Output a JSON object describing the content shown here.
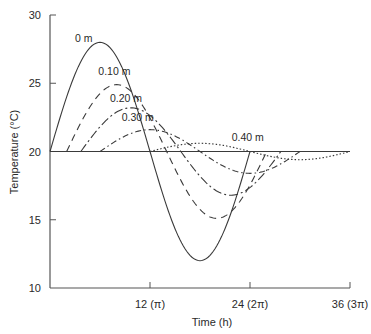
{
  "chart_data": {
    "type": "line",
    "title": "",
    "xlabel": "Time (h)",
    "ylabel": "Temperature (°C)",
    "xlim": [
      0,
      36
    ],
    "ylim": [
      10,
      30
    ],
    "grid": false,
    "legend": "inline labels near curves",
    "x_ticks": [
      {
        "value": 12,
        "label": "12 (π)"
      },
      {
        "value": 24,
        "label": "24 (2π)"
      },
      {
        "value": 36,
        "label": "36 (3π)"
      }
    ],
    "y_ticks": [
      {
        "value": 10,
        "label": "10"
      },
      {
        "value": 15,
        "label": "15"
      },
      {
        "value": 20,
        "label": "20"
      },
      {
        "value": 25,
        "label": "25"
      },
      {
        "value": 30,
        "label": "30"
      }
    ],
    "reference_line": {
      "y": 20,
      "x_start": 0,
      "x_end": 36
    },
    "series": [
      {
        "name": "0 m",
        "style": "solid",
        "mean": 20,
        "amplitude": 8,
        "lag_h": 0,
        "label_pos": {
          "t": 3.0,
          "T": 28.0
        },
        "points": [
          [
            0,
            20
          ],
          [
            3,
            25.66
          ],
          [
            6,
            28
          ],
          [
            9,
            25.66
          ],
          [
            12,
            20
          ],
          [
            15,
            14.34
          ],
          [
            18,
            12
          ],
          [
            21,
            14.34
          ],
          [
            24,
            20
          ]
        ]
      },
      {
        "name": "0.10 m",
        "style": "dashed",
        "mean": 20,
        "amplitude": 4.9,
        "lag_h": 2,
        "label_pos": {
          "t": 5.8,
          "T": 25.6
        },
        "points": [
          [
            2,
            20
          ],
          [
            5,
            23.46
          ],
          [
            8,
            24.9
          ],
          [
            11,
            23.46
          ],
          [
            14,
            20
          ],
          [
            17,
            16.54
          ],
          [
            20,
            15.1
          ],
          [
            23,
            16.54
          ],
          [
            26,
            20
          ]
        ]
      },
      {
        "name": "0.20 m",
        "style": "long-dash-dot",
        "mean": 20,
        "amplitude": 3.2,
        "lag_h": 3.7,
        "label_pos": {
          "t": 7.2,
          "T": 23.6
        },
        "points": [
          [
            3.7,
            20
          ],
          [
            6.7,
            22.26
          ],
          [
            9.7,
            23.2
          ],
          [
            12.7,
            22.26
          ],
          [
            15.7,
            20
          ],
          [
            18.7,
            17.74
          ],
          [
            21.7,
            16.8
          ],
          [
            24.7,
            17.74
          ],
          [
            27.7,
            20
          ]
        ]
      },
      {
        "name": "0.30 m",
        "style": "dash-dot",
        "mean": 20,
        "amplitude": 1.6,
        "lag_h": 6,
        "label_pos": {
          "t": 8.6,
          "T": 22.2
        },
        "points": [
          [
            6,
            20
          ],
          [
            9,
            21.13
          ],
          [
            12,
            21.6
          ],
          [
            15,
            21.13
          ],
          [
            18,
            20
          ],
          [
            21,
            18.87
          ],
          [
            24,
            18.4
          ],
          [
            27,
            18.87
          ],
          [
            30,
            20
          ]
        ]
      },
      {
        "name": "0.40 m",
        "style": "dotted",
        "mean": 20,
        "amplitude": 0.6,
        "lag_h": 12,
        "label_pos": {
          "t": 21.8,
          "T": 20.8
        },
        "points": [
          [
            12,
            20
          ],
          [
            15,
            20.42
          ],
          [
            18,
            20.6
          ],
          [
            21,
            20.42
          ],
          [
            24,
            20
          ],
          [
            27,
            19.58
          ],
          [
            30,
            19.4
          ],
          [
            33,
            19.58
          ],
          [
            36,
            20
          ]
        ]
      }
    ]
  },
  "colors": {
    "axis": "#555555",
    "curve": "#3a3a3a",
    "background": "#ffffff"
  }
}
